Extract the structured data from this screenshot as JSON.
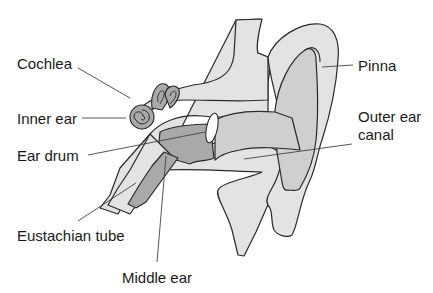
{
  "diagram": {
    "colors": {
      "light_tissue": "#e3e3e3",
      "medium_tissue": "#cfcfcf",
      "dark_tissue": "#a9a9a9",
      "outline": "#2a2a2a",
      "ear_drum": "#ffffff",
      "label_text": "#1a1a1a"
    },
    "labels": {
      "cochlea": "Cochlea",
      "inner_ear": "Inner ear",
      "ear_drum": "Ear drum",
      "eustachian_tube": "Eustachian tube",
      "middle_ear": "Middle ear",
      "pinna": "Pinna",
      "outer_ear_canal_line1": "Outer ear",
      "outer_ear_canal_line2": "canal"
    }
  }
}
